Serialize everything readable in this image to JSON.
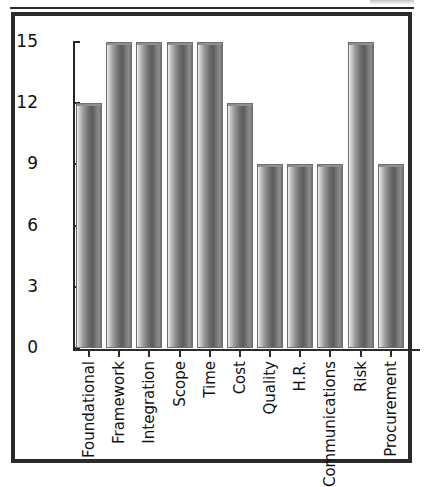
{
  "chart_data": {
    "type": "bar",
    "title": "",
    "subtitle": "",
    "xlabel": "",
    "ylabel": "",
    "categories": [
      "Foundational",
      "Framework",
      "Integration",
      "Scope",
      "Time",
      "Cost",
      "Quality",
      "H.R.",
      "Communications",
      "Risk",
      "Procurement"
    ],
    "values": [
      12,
      15,
      15,
      15,
      15,
      12,
      9,
      9,
      9,
      15,
      9
    ],
    "ylim": [
      0,
      15
    ],
    "ytick_labels": [
      "0",
      "3",
      "6",
      "9",
      "12",
      "15"
    ],
    "ytick_values": [
      0,
      3,
      6,
      9,
      12,
      15
    ],
    "grid": false,
    "legend": null,
    "legend_position": "none",
    "bar_style": "cylinder-gradient-grayscale",
    "colors": {
      "bar_light": "#f2f2f2",
      "bar_mid": "#9a9a9a",
      "bar_dark": "#5c5c5c",
      "bar_outline": "#6f6f6f",
      "axis": "#262626",
      "frame": "#2b2b2b",
      "text": "#111111",
      "background": "#ffffff"
    }
  }
}
